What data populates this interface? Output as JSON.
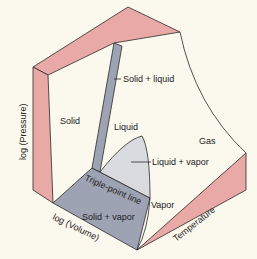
{
  "title_cutoff": "Pressure-volume-temperature surface (cut off)",
  "colors": {
    "background": "#fbf8ee",
    "pink_wall": "#e9a9a6",
    "gray_region": "#9ea3b4",
    "light_gray_dome": "#d9dbe1",
    "outline": "#2a2a2a",
    "cut_text": "#c0392b"
  },
  "regions": {
    "solid": "Solid",
    "solid_liquid": "Solid + liquid",
    "liquid": "Liquid",
    "liquid_vapor": "Liquid + vapor",
    "gas": "Gas",
    "vapor": "Vapor",
    "solid_vapor": "Solid + vapor",
    "triple_point_line": "Triple-point line"
  },
  "axes": {
    "pressure": "log (Pressure)",
    "volume": "log (Volume)",
    "temperature": "Temperature"
  }
}
